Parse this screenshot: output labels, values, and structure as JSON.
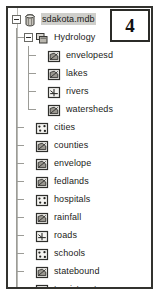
{
  "callout": {
    "number": "4",
    "name": "callout-badge"
  },
  "tree": {
    "root": {
      "label": "sdakota.mdb",
      "icon": "geodatabase-icon",
      "selected": true,
      "expanded": true,
      "depth": 0
    },
    "items": [
      {
        "label": "sdakota.mdb",
        "icon": "geodatabase-icon",
        "depth": 0,
        "selected": true,
        "toggle": "collapse",
        "last": false
      },
      {
        "label": "Hydrology",
        "icon": "feature-dataset-icon",
        "depth": 1,
        "selected": false,
        "toggle": "collapse",
        "last": false
      },
      {
        "label": "envelopesd",
        "icon": "polygon-feature-class-icon",
        "depth": 2,
        "selected": false,
        "toggle": "none",
        "last": false
      },
      {
        "label": "lakes",
        "icon": "polygon-feature-class-icon",
        "depth": 2,
        "selected": false,
        "toggle": "none",
        "last": false
      },
      {
        "label": "rivers",
        "icon": "line-feature-class-icon",
        "depth": 2,
        "selected": false,
        "toggle": "none",
        "last": false
      },
      {
        "label": "watersheds",
        "icon": "polygon-feature-class-icon",
        "depth": 2,
        "selected": false,
        "toggle": "none",
        "last": true
      },
      {
        "label": "cities",
        "icon": "point-feature-class-icon",
        "depth": 1,
        "selected": false,
        "toggle": "none",
        "last": false
      },
      {
        "label": "counties",
        "icon": "polygon-feature-class-icon",
        "depth": 1,
        "selected": false,
        "toggle": "none",
        "last": false
      },
      {
        "label": "envelope",
        "icon": "polygon-feature-class-icon",
        "depth": 1,
        "selected": false,
        "toggle": "none",
        "last": false
      },
      {
        "label": "fedlands",
        "icon": "polygon-feature-class-icon",
        "depth": 1,
        "selected": false,
        "toggle": "none",
        "last": false
      },
      {
        "label": "hospitals",
        "icon": "point-feature-class-icon",
        "depth": 1,
        "selected": false,
        "toggle": "none",
        "last": false
      },
      {
        "label": "rainfall",
        "icon": "polygon-feature-class-icon",
        "depth": 1,
        "selected": false,
        "toggle": "none",
        "last": false
      },
      {
        "label": "roads",
        "icon": "line-feature-class-icon",
        "depth": 1,
        "selected": false,
        "toggle": "none",
        "last": false
      },
      {
        "label": "schools",
        "icon": "point-feature-class-icon",
        "depth": 1,
        "selected": false,
        "toggle": "none",
        "last": false
      },
      {
        "label": "statebound",
        "icon": "polygon-feature-class-icon",
        "depth": 1,
        "selected": false,
        "toggle": "none",
        "last": false
      },
      {
        "label": "touristspots",
        "icon": "point-feature-class-icon",
        "depth": 1,
        "selected": false,
        "toggle": "none",
        "last": false
      },
      {
        "label": "urbanareas",
        "icon": "polygon-feature-class-icon",
        "depth": 1,
        "selected": false,
        "toggle": "none",
        "last": true
      }
    ]
  },
  "colors": {
    "frame_border": "#33332f",
    "selection": "#cfcfcb",
    "tree_line": "#9c9c97",
    "text": "#1b1b19",
    "background": "#ffffff"
  }
}
